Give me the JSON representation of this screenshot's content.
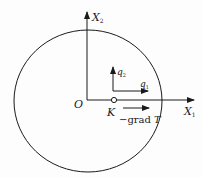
{
  "diagram": {
    "axes": {
      "x1": {
        "label": "X",
        "subscript": "1"
      },
      "x2": {
        "label": "X",
        "subscript": "2"
      },
      "origin_label": "O"
    },
    "point": {
      "label": "K"
    },
    "vectors": {
      "q1": {
        "label": "q",
        "subscript": "1"
      },
      "q2": {
        "label": "q",
        "subscript": "2"
      },
      "grad": {
        "prefix": "−grad ",
        "symbol": "T"
      }
    },
    "colors": {
      "stroke": "#1a1a1a",
      "background": "#fdfdfd"
    }
  }
}
